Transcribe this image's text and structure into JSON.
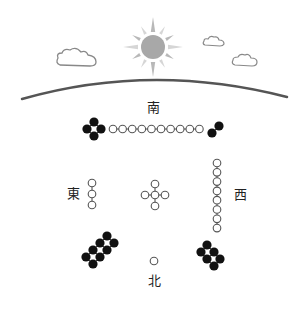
{
  "labels": {
    "south": "南",
    "east": "東",
    "west": "西",
    "north": "北"
  },
  "sky": {
    "sun": "sun-icon",
    "clouds": [
      "cloud-icon",
      "cloud-icon",
      "cloud-icon"
    ],
    "horizon": "horizon-arc"
  },
  "groups": [
    {
      "name": "south-black-cluster",
      "fill": "black",
      "count": 4
    },
    {
      "name": "south-white-row",
      "fill": "white",
      "count": 10
    },
    {
      "name": "south-black-pair",
      "fill": "black",
      "count": 2
    },
    {
      "name": "east-white-column",
      "fill": "white",
      "count": 3
    },
    {
      "name": "center-white-cross",
      "fill": "white",
      "count": 5
    },
    {
      "name": "west-white-column",
      "fill": "white",
      "count": 8
    },
    {
      "name": "southwest-black-ladder",
      "fill": "black",
      "count": 8
    },
    {
      "name": "north-white-single",
      "fill": "white",
      "count": 1
    },
    {
      "name": "northeast-black-ladder",
      "fill": "black",
      "count": 6
    }
  ],
  "colors": {
    "black_dot": "#111111",
    "white_dot_stroke": "#555555",
    "sun": "#a8a8a8",
    "ray": "#b8b8b8",
    "cloud_stroke": "#888888",
    "horizon": "#555555"
  }
}
